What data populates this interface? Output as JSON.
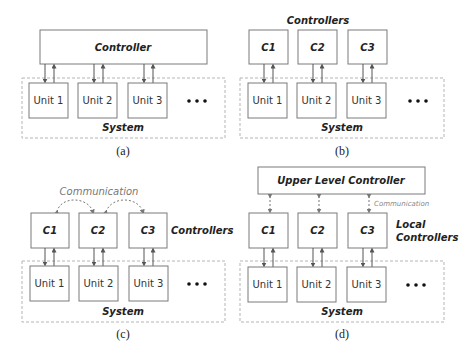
{
  "panels": {
    "a": {
      "caption": "(a)",
      "controller": "Controller",
      "units": [
        "Unit 1",
        "Unit 2",
        "Unit 3"
      ],
      "system": "System",
      "ellipsis": "•••"
    },
    "b": {
      "caption": "(b)",
      "controllers_label": "Controllers",
      "controllers": [
        "C1",
        "C2",
        "C3"
      ],
      "units": [
        "Unit 1",
        "Unit 2",
        "Unit 3"
      ],
      "system": "System",
      "ellipsis": "•••"
    },
    "c": {
      "caption": "(c)",
      "communication": "Communication",
      "controllers_label": "Controllers",
      "controllers": [
        "C1",
        "C2",
        "C3"
      ],
      "units": [
        "Unit 1",
        "Unit 2",
        "Unit 3"
      ],
      "system": "System",
      "ellipsis": "•••"
    },
    "d": {
      "caption": "(d)",
      "upper_controller": "Upper Level Controller",
      "communication": "Communication",
      "local_controllers_label_line1": "Local",
      "local_controllers_label_line2": "Controllers",
      "controllers": [
        "C1",
        "C2",
        "C3"
      ],
      "units": [
        "Unit 1",
        "Unit 2",
        "Unit 3"
      ],
      "system": "System",
      "ellipsis": "•••"
    }
  },
  "colors": {
    "box_stroke": "#7a7a7a",
    "dashed_stroke": "#b5b5b5",
    "text": "#222222",
    "communication_text": "#777777"
  }
}
